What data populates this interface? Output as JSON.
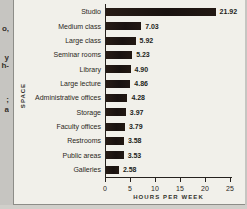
{
  "chart_data": {
    "type": "bar",
    "orientation": "horizontal",
    "title": "",
    "categories": [
      "Studio",
      "Medium class",
      "Large class",
      "Seminar rooms",
      "Library",
      "Large lecture",
      "Administrative offices",
      "Storage",
      "Faculty offices",
      "Restrooms",
      "Public areas",
      "Galleries"
    ],
    "values": [
      21.92,
      7.03,
      5.92,
      5.23,
      4.9,
      4.86,
      4.28,
      3.97,
      3.79,
      3.58,
      3.53,
      2.58
    ],
    "value_labels": [
      "21.92",
      "7.03",
      "5.92",
      "5.23",
      "4.90",
      "4.86",
      "4.28",
      "3.97",
      "3.79",
      "3.58",
      "3.53",
      "2.58"
    ],
    "xlabel": "HOURS PER WEEK",
    "ylabel": "SPACE",
    "xticks": [
      0,
      5,
      10,
      15,
      20,
      25
    ],
    "xlim": [
      0,
      25
    ],
    "grid": false,
    "legend": "none",
    "bar_color": "#1c1410"
  },
  "page_margin_fragments": [
    {
      "text": "o,",
      "top": 25
    },
    {
      "text": "y",
      "top": 54
    },
    {
      "text": "h-",
      "top": 62
    },
    {
      "text": ";",
      "top": 96
    },
    {
      "text": "a",
      "top": 106
    }
  ],
  "colors": {
    "page_background": "#c6c5c1",
    "figure_background": "#f1f0ea",
    "bar": "#1c1410",
    "axis": "#26221e",
    "text": "#2b2722",
    "rule": "#8d8d88"
  }
}
